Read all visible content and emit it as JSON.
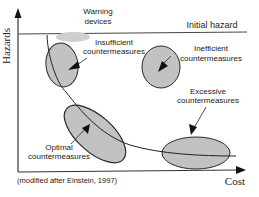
{
  "diagram": {
    "axes": {
      "y_label": "Hazards",
      "x_label": "Cost"
    },
    "reference_line": {
      "label": "Initial hazard"
    },
    "regions": [
      {
        "id": "warning-devices",
        "label_line1": "Warning",
        "label_line2": "devices"
      },
      {
        "id": "insufficient",
        "label_line1": "Insufficient",
        "label_line2": "countermeasures"
      },
      {
        "id": "inefficient",
        "label_line1": "Inefficient",
        "label_line2": "countermeasures"
      },
      {
        "id": "excessive",
        "label_line1": "Excessive",
        "label_line2": "countermeasures"
      },
      {
        "id": "optimal",
        "label_line1": "Optimal",
        "label_line2": "countermeasures"
      }
    ],
    "caption": "(modified after Einstein, 1997)",
    "colors": {
      "fill": "#c2c2c2",
      "stroke": "#2a2a2a",
      "warning_fill": "#cfcfcf"
    }
  }
}
